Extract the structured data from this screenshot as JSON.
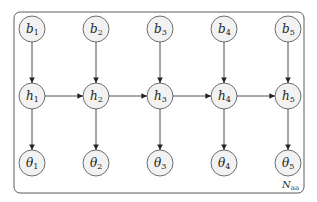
{
  "diagram": {
    "type": "graphical-model",
    "plate": {
      "label": "N",
      "subscript": "aa",
      "x": 14,
      "y": 12,
      "width": 290,
      "height": 181,
      "radius": 6
    },
    "columns_x": [
      32,
      96,
      160,
      224,
      288
    ],
    "rows": [
      {
        "name": "b",
        "y": 29,
        "symbol": "b",
        "subscripts": [
          "1",
          "2",
          "3",
          "4",
          "5"
        ]
      },
      {
        "name": "h",
        "y": 96,
        "symbol": "h",
        "subscripts": [
          "1",
          "2",
          "3",
          "4",
          "5"
        ]
      },
      {
        "name": "theta",
        "y": 163,
        "symbol": "θ",
        "subscripts": [
          "1",
          "2",
          "3",
          "4",
          "5"
        ]
      }
    ],
    "node_radius": 13,
    "edges": [
      {
        "from": "b1",
        "to": "h1"
      },
      {
        "from": "b2",
        "to": "h2"
      },
      {
        "from": "b3",
        "to": "h3"
      },
      {
        "from": "b4",
        "to": "h4"
      },
      {
        "from": "b5",
        "to": "h5"
      },
      {
        "from": "h1",
        "to": "theta1"
      },
      {
        "from": "h2",
        "to": "theta2"
      },
      {
        "from": "h3",
        "to": "theta3"
      },
      {
        "from": "h4",
        "to": "theta4"
      },
      {
        "from": "h5",
        "to": "theta5"
      },
      {
        "from": "h1",
        "to": "h2"
      },
      {
        "from": "h2",
        "to": "h3"
      },
      {
        "from": "h3",
        "to": "h4"
      },
      {
        "from": "h4",
        "to": "h5"
      }
    ],
    "colors": {
      "node_fill": "#f2f2f2",
      "stroke": "#4a4a4a",
      "edge": "#222222"
    }
  }
}
